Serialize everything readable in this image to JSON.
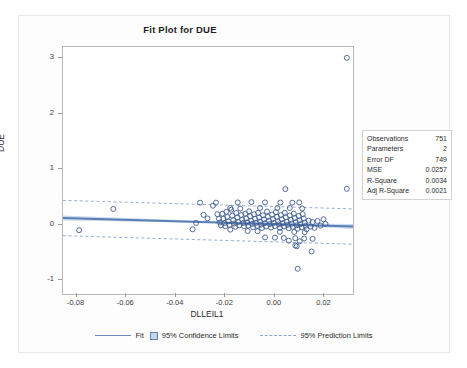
{
  "figure": {
    "title": "Fit Plot for DUE"
  },
  "stats": {
    "rows": [
      {
        "label": "Observations",
        "value": "751"
      },
      {
        "label": "Parameters",
        "value": "2"
      },
      {
        "label": "Error DF",
        "value": "749"
      },
      {
        "label": "MSE",
        "value": "0.0257"
      },
      {
        "label": "R-Square",
        "value": "0.0034"
      },
      {
        "label": "Adj R-Square",
        "value": "0.0021"
      }
    ]
  },
  "legend": {
    "fit_label": "Fit",
    "confidence_label": "95% Confidence Limits",
    "prediction_label": "95% Prediction Limits"
  },
  "colors": {
    "fit_line": "#5b7fb4",
    "confidence_band": "#c3d4ea",
    "prediction_limits": "#8ba3c9",
    "marker_stroke": "#3f5d94",
    "axis": "#b9b9b9",
    "text": "#2b2b2b",
    "background": "#ffffff"
  },
  "chart_data": {
    "type": "scatter",
    "title": "Fit Plot for DUE",
    "xlabel": "DLLEIL1",
    "ylabel": "DUE",
    "xlim": [
      -0.0855,
      0.0315
    ],
    "ylim": [
      -1.25,
      3.2
    ],
    "xticks": [
      -0.08,
      -0.06,
      -0.04,
      -0.02,
      0.0,
      0.02
    ],
    "xtick_labels": [
      "-0.08",
      "-0.06",
      "-0.04",
      "-0.02",
      "0.00",
      "0.02"
    ],
    "yticks": [
      -1,
      0,
      1,
      2,
      3
    ],
    "ytick_labels": [
      "-1",
      "0",
      "1",
      "2",
      "3"
    ],
    "grid": false,
    "legend_position": "bottom",
    "n_observations": 751,
    "fit": {
      "type": "linear",
      "intercept": 0.0065,
      "slope": -1.32,
      "x_start": -0.0855,
      "x_end": 0.0315,
      "y_start": 0.1194,
      "y_end": -0.0351
    },
    "confidence_band": {
      "label": "95% Confidence Limits",
      "x": [
        -0.0855,
        -0.06,
        -0.04,
        -0.02,
        0.0,
        0.01,
        0.0315
      ],
      "upper": [
        0.163,
        0.119,
        0.086,
        0.055,
        0.031,
        0.022,
        0.01
      ],
      "lower": [
        0.076,
        0.056,
        0.041,
        0.023,
        -0.006,
        -0.026,
        -0.08
      ]
    },
    "prediction_limits": {
      "label": "95% Prediction Limits",
      "x": [
        -0.0855,
        0.0315
      ],
      "upper": [
        0.437,
        0.283
      ],
      "lower": [
        -0.199,
        -0.353
      ]
    },
    "series": [
      {
        "name": "DUE",
        "marker": "open-circle",
        "points": [
          [
            -0.079,
            -0.1
          ],
          [
            -0.0652,
            0.283
          ],
          [
            -0.0332,
            -0.085
          ],
          [
            -0.0318,
            0.03
          ],
          [
            -0.0302,
            0.395
          ],
          [
            -0.0288,
            0.176
          ],
          [
            -0.0272,
            0.112
          ],
          [
            -0.0238,
            0.396
          ],
          [
            -0.0232,
            0.188
          ],
          [
            -0.0226,
            0.106
          ],
          [
            -0.0222,
            0.038
          ],
          [
            -0.0218,
            -0.012
          ],
          [
            -0.0212,
            0.196
          ],
          [
            -0.0208,
            0.108
          ],
          [
            -0.0204,
            0.026
          ],
          [
            -0.02,
            -0.03
          ],
          [
            -0.0196,
            0.232
          ],
          [
            -0.0192,
            0.14
          ],
          [
            -0.0188,
            0.058
          ],
          [
            -0.0184,
            -0.006
          ],
          [
            -0.018,
            -0.09
          ],
          [
            -0.0176,
            0.268
          ],
          [
            -0.0172,
            0.16
          ],
          [
            -0.0168,
            0.082
          ],
          [
            -0.0164,
            0.02
          ],
          [
            -0.016,
            -0.04
          ],
          [
            -0.0156,
            0.21
          ],
          [
            -0.0152,
            0.128
          ],
          [
            -0.0148,
            0.046
          ],
          [
            -0.0144,
            -0.014
          ],
          [
            -0.014,
            0.29
          ],
          [
            -0.0136,
            0.174
          ],
          [
            -0.0132,
            0.09
          ],
          [
            -0.0128,
            0.03
          ],
          [
            -0.0124,
            -0.03
          ],
          [
            -0.012,
            0.196
          ],
          [
            -0.0116,
            0.112
          ],
          [
            -0.0112,
            0.04
          ],
          [
            -0.0108,
            -0.02
          ],
          [
            -0.0104,
            0.24
          ],
          [
            -0.01,
            0.15
          ],
          [
            -0.0096,
            0.07
          ],
          [
            -0.0092,
            0.014
          ],
          [
            -0.0088,
            -0.05
          ],
          [
            -0.0084,
            0.186
          ],
          [
            -0.008,
            0.104
          ],
          [
            -0.0076,
            0.034
          ],
          [
            -0.0072,
            -0.024
          ],
          [
            -0.0068,
            0.212
          ],
          [
            -0.0064,
            0.126
          ],
          [
            -0.006,
            0.054
          ],
          [
            -0.0056,
            0.0
          ],
          [
            -0.0052,
            -0.06
          ],
          [
            -0.0048,
            0.168
          ],
          [
            -0.0044,
            0.092
          ],
          [
            -0.004,
            0.028
          ],
          [
            -0.0036,
            -0.034
          ],
          [
            -0.0032,
            0.236
          ],
          [
            -0.0028,
            0.144
          ],
          [
            -0.0024,
            0.066
          ],
          [
            -0.002,
            0.01
          ],
          [
            -0.0016,
            -0.052
          ],
          [
            -0.0012,
            0.18
          ],
          [
            -0.0008,
            0.1
          ],
          [
            -0.0004,
            0.032
          ],
          [
            0.0,
            -0.026
          ],
          [
            0.0004,
            0.226
          ],
          [
            0.0008,
            0.138
          ],
          [
            0.0012,
            0.06
          ],
          [
            0.0016,
            0.004
          ],
          [
            0.002,
            -0.058
          ],
          [
            0.0024,
            0.172
          ],
          [
            0.0028,
            0.096
          ],
          [
            0.0032,
            0.026
          ],
          [
            0.0036,
            -0.032
          ],
          [
            0.004,
            0.214
          ],
          [
            0.0044,
            0.13
          ],
          [
            0.0048,
            0.052
          ],
          [
            0.0052,
            -0.004
          ],
          [
            0.0056,
            -0.066
          ],
          [
            0.006,
            0.164
          ],
          [
            0.0064,
            0.086
          ],
          [
            0.0068,
            0.018
          ],
          [
            0.0072,
            -0.04
          ],
          [
            0.0076,
            0.198
          ],
          [
            0.008,
            0.118
          ],
          [
            0.0084,
            0.044
          ],
          [
            0.0088,
            -0.012
          ],
          [
            0.0092,
            -0.074
          ],
          [
            0.0096,
            0.156
          ],
          [
            0.01,
            0.078
          ],
          [
            0.0104,
            0.01
          ],
          [
            0.0108,
            -0.048
          ],
          [
            0.0112,
            0.19
          ],
          [
            0.0116,
            0.108
          ],
          [
            0.012,
            0.036
          ],
          [
            0.0124,
            -0.022
          ],
          [
            0.0128,
            -0.084
          ],
          [
            0.0136,
            0.072
          ],
          [
            0.0144,
            -0.036
          ],
          [
            0.0152,
            0.046
          ],
          [
            0.016,
            -0.058
          ],
          [
            0.0172,
            0.064
          ],
          [
            0.0184,
            -0.018
          ],
          [
            0.0196,
            0.096
          ],
          [
            0.0204,
            0.012
          ],
          [
            -0.015,
            0.4
          ],
          [
            -0.0095,
            0.405
          ],
          [
            -0.004,
            0.4
          ],
          [
            0.0022,
            0.398
          ],
          [
            0.007,
            0.395
          ],
          [
            0.0098,
            0.4
          ],
          [
            0.0042,
            0.64
          ],
          [
            0.029,
            0.645
          ],
          [
            -0.025,
            0.34
          ],
          [
            -0.018,
            0.3
          ],
          [
            -0.006,
            0.3
          ],
          [
            0.001,
            0.3
          ],
          [
            0.006,
            0.3
          ],
          [
            0.011,
            0.29
          ],
          [
            -0.011,
            -0.115
          ],
          [
            -0.007,
            -0.12
          ],
          [
            0.002,
            -0.13
          ],
          [
            0.0078,
            -0.132
          ],
          [
            0.012,
            -0.135
          ],
          [
            -0.004,
            -0.23
          ],
          [
            0.0,
            -0.235
          ],
          [
            0.0036,
            -0.24
          ],
          [
            0.0082,
            -0.245
          ],
          [
            0.0118,
            -0.25
          ],
          [
            0.0152,
            -0.255
          ],
          [
            0.0056,
            -0.29
          ],
          [
            0.01,
            -0.3
          ],
          [
            0.0082,
            -0.375
          ],
          [
            0.0088,
            -0.39
          ],
          [
            0.0148,
            -0.485
          ],
          [
            0.0092,
            -0.795
          ],
          [
            0.029,
            3.005
          ]
        ]
      }
    ]
  }
}
